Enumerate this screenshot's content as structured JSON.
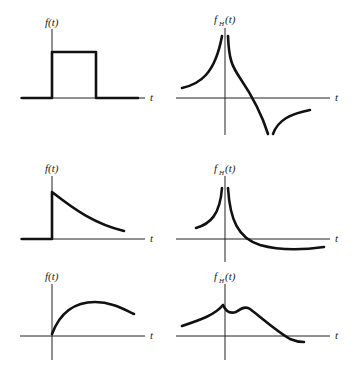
{
  "figure": {
    "rows": [
      {
        "left": {
          "ylabel": "f(t)",
          "xlabel": "t",
          "shape": "rectangular pulse"
        },
        "right": {
          "ylabel_main": "f",
          "ylabel_sub": "H",
          "ylabel_arg": "(t)",
          "xlabel": "t",
          "shape": "log singularities at pulse edges"
        }
      },
      {
        "left": {
          "ylabel": "f(t)",
          "xlabel": "t",
          "shape": "step-onset decaying exponential"
        },
        "right": {
          "ylabel_main": "f",
          "ylabel_sub": "H",
          "ylabel_arg": "(t)",
          "xlabel": "t",
          "shape": "log singularity at origin"
        }
      },
      {
        "left": {
          "ylabel": "f(t)",
          "xlabel": "t",
          "shape": "smooth rising then falling curve"
        },
        "right": {
          "ylabel_main": "f",
          "ylabel_sub": "H",
          "ylabel_arg": "(t)",
          "xlabel": "t",
          "shape": "cusp at origin with secondary bump"
        }
      }
    ]
  }
}
